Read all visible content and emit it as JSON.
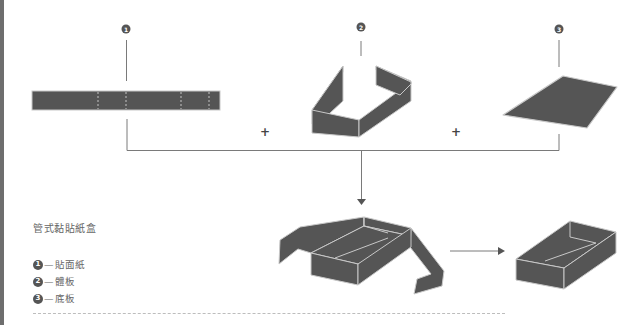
{
  "caption": "管式黏貼紙盒",
  "legend": [
    {
      "number": "1",
      "dash": "—",
      "label": "貼面紙"
    },
    {
      "number": "2",
      "dash": "—",
      "label": "體板"
    },
    {
      "number": "3",
      "dash": "—",
      "label": "底板"
    }
  ],
  "callouts": [
    {
      "number": "1",
      "part": "貼面紙"
    },
    {
      "number": "2",
      "part": "體板"
    },
    {
      "number": "3",
      "part": "底板"
    }
  ],
  "operators": {
    "plus": "+"
  },
  "colors": {
    "fill": "#555555",
    "edge": "#c8c8c8",
    "line": "#7a7a7a",
    "badge": "#555555",
    "left_bar": "#6e6e6e"
  }
}
